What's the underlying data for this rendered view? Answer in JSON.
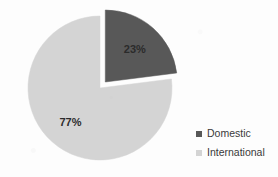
{
  "chart_data": {
    "type": "pie",
    "title": "",
    "categories": [
      "Domestic",
      "International"
    ],
    "values": [
      23,
      77
    ],
    "value_labels": [
      "23%",
      "77%"
    ],
    "colors": [
      "#585858",
      "#d4d4d4"
    ],
    "exploded": [
      "Domestic"
    ],
    "start_angle_deg": 0,
    "direction": "clockwise",
    "legend_position": "right",
    "grid": false,
    "xlabel": "",
    "ylabel": "",
    "slices": [
      {
        "name": "Domestic",
        "value": 23,
        "label": "23%",
        "color": "#585858",
        "start_deg": 0,
        "end_deg": 82.8,
        "exploded": true
      },
      {
        "name": "International",
        "value": 77,
        "label": "77%",
        "color": "#d4d4d4",
        "start_deg": 82.8,
        "end_deg": 360,
        "exploded": false
      }
    ]
  },
  "legend": {
    "items": [
      {
        "label": "Domestic",
        "color": "#585858",
        "marker": "square-marker"
      },
      {
        "label": "International",
        "color": "#d4d4d4",
        "marker": "square-marker"
      }
    ]
  },
  "labels": {
    "domestic_pct": "23%",
    "international_pct": "77%"
  }
}
